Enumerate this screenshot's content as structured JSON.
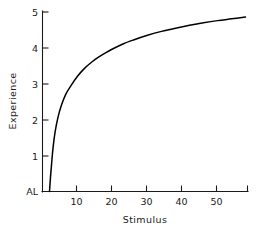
{
  "chart_data": {
    "type": "line",
    "title": "",
    "subtitle": "",
    "xlabel": "Stimulus",
    "ylabel": "Experience",
    "xlim": [
      0,
      58
    ],
    "ylim": [
      0,
      5
    ],
    "grid": false,
    "legend": null,
    "x_ticks": [
      10,
      20,
      30,
      40,
      50
    ],
    "x_tick_labels": [
      "10",
      "20",
      "30",
      "40",
      "50"
    ],
    "y_ticks": [
      0,
      1,
      2,
      3,
      4,
      5
    ],
    "y_tick_labels": [
      "AL",
      "1",
      "2",
      "3",
      "4",
      "5"
    ],
    "annotations": [
      {
        "text": "AL",
        "meaning": "absolute-limen-baseline",
        "x": 0,
        "y": 0
      }
    ],
    "series": [
      {
        "name": "Fechner logarithmic curve",
        "x": [
          2.0,
          2.1,
          2.3,
          2.6,
          3.0,
          3.6,
          4.4,
          5.4,
          6.6,
          8.0,
          10.0,
          12.0,
          14.0,
          16.0,
          18.0,
          20.0,
          23.0,
          26.0,
          30.0,
          34.0,
          38.0,
          42.0,
          46.0,
          50.0,
          54.0,
          58.0
        ],
        "y": [
          0.0,
          0.15,
          0.42,
          0.77,
          1.21,
          1.66,
          2.06,
          2.4,
          2.7,
          2.93,
          3.21,
          3.43,
          3.6,
          3.74,
          3.86,
          3.97,
          4.11,
          4.22,
          4.35,
          4.46,
          4.55,
          4.63,
          4.7,
          4.76,
          4.81,
          4.86
        ]
      }
    ]
  },
  "axes": {
    "y_axis_name": "Experience",
    "x_axis_name": "Stimulus"
  },
  "colors": {
    "curve": "#000000",
    "axis": "#1a1a1a",
    "background": "#ffffff"
  }
}
